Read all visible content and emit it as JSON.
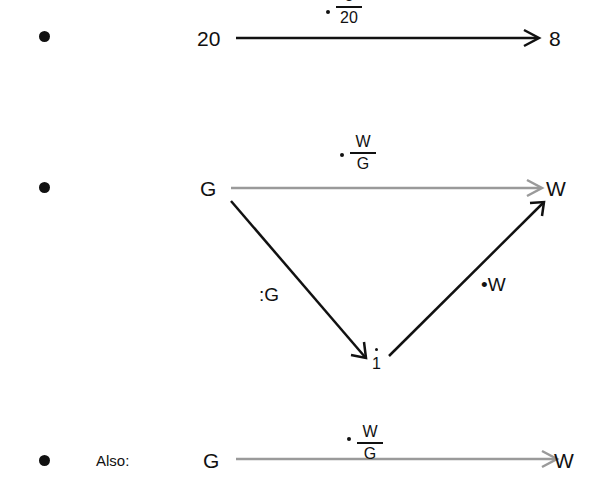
{
  "rows": [
    {
      "source": "20",
      "target": "8",
      "edge_label": {
        "operator": "·",
        "numerator": "8",
        "denominator": "20"
      },
      "edge_color": "#111111"
    },
    {
      "top": {
        "source": "G",
        "target": "W",
        "edge_label": {
          "operator": "·",
          "numerator": "W",
          "denominator": "G"
        },
        "edge_color": "#9a9a9a"
      },
      "middle_node": "1",
      "left_edge_label": ":G",
      "right_edge_label": "•W",
      "diagonal_color": "#111111"
    },
    {
      "prefix": "Also:",
      "source": "G",
      "target": "W",
      "edge_label": {
        "operator": "·",
        "numerator": "W",
        "denominator": "G"
      },
      "edge_color": "#9a9a9a"
    }
  ]
}
